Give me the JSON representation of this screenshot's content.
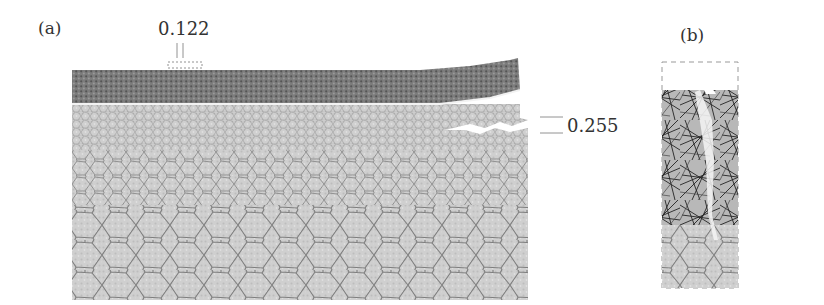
{
  "panels": {
    "a": {
      "label": "(a)",
      "annotations": {
        "top_gap": "0.122",
        "crack_opening": "0.255"
      }
    },
    "b": {
      "label": "(b)"
    }
  },
  "colors": {
    "mesh_fill": "#c9c9c9",
    "grain_boundary": "#7a7a7a",
    "coating_dark": "#6e6e6e",
    "fiber": "#2a2a2a",
    "text": "#333333"
  }
}
